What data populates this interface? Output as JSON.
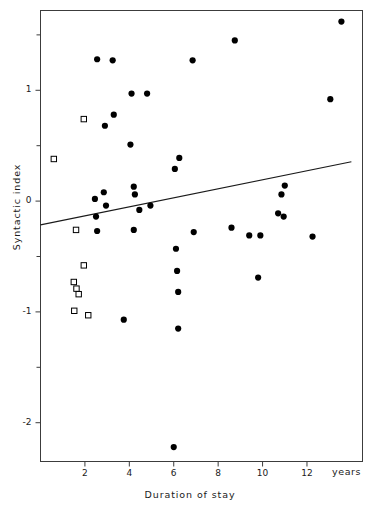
{
  "chart_data": {
    "type": "scatter",
    "title": "",
    "xlabel": "Duration of stay",
    "ylabel": "Syntactic index",
    "x_unit_label": "years",
    "xlim": [
      0.0,
      14.5
    ],
    "ylim": [
      -2.35,
      1.72
    ],
    "xticks": [
      2,
      4,
      6,
      8,
      10,
      12
    ],
    "xtick_labels": [
      "2",
      "4",
      "6",
      "8",
      "10",
      "12"
    ],
    "yticks": [
      1,
      0,
      -1,
      -2
    ],
    "ytick_labels": [
      "1",
      "0",
      "-1",
      "-2"
    ],
    "y_minor_ticks": [
      1.5,
      0.5,
      -0.5,
      -1.5
    ],
    "grid": false,
    "legend": null,
    "series": [
      {
        "name": "filled-circles",
        "marker": "circle-filled",
        "color": "#000000",
        "points": [
          [
            13.55,
            1.62
          ],
          [
            8.75,
            1.45
          ],
          [
            2.55,
            1.28
          ],
          [
            3.25,
            1.27
          ],
          [
            6.85,
            1.27
          ],
          [
            4.1,
            0.97
          ],
          [
            4.8,
            0.97
          ],
          [
            13.05,
            0.92
          ],
          [
            3.3,
            0.78
          ],
          [
            2.9,
            0.68
          ],
          [
            4.05,
            0.51
          ],
          [
            6.25,
            0.39
          ],
          [
            6.05,
            0.29
          ],
          [
            4.2,
            0.13
          ],
          [
            4.25,
            0.06
          ],
          [
            2.85,
            0.08
          ],
          [
            11.0,
            0.14
          ],
          [
            2.45,
            0.02
          ],
          [
            10.85,
            0.06
          ],
          [
            2.95,
            -0.04
          ],
          [
            4.45,
            -0.08
          ],
          [
            4.95,
            -0.04
          ],
          [
            10.7,
            -0.11
          ],
          [
            10.95,
            -0.14
          ],
          [
            2.5,
            -0.14
          ],
          [
            2.55,
            -0.27
          ],
          [
            4.2,
            -0.26
          ],
          [
            8.6,
            -0.24
          ],
          [
            6.9,
            -0.28
          ],
          [
            9.4,
            -0.31
          ],
          [
            9.9,
            -0.31
          ],
          [
            12.25,
            -0.32
          ],
          [
            6.1,
            -0.43
          ],
          [
            6.15,
            -0.63
          ],
          [
            9.8,
            -0.69
          ],
          [
            6.2,
            -0.82
          ],
          [
            3.75,
            -1.07
          ],
          [
            6.2,
            -1.15
          ],
          [
            6.0,
            -2.22
          ]
        ]
      },
      {
        "name": "open-squares",
        "marker": "square-open",
        "color": "#000000",
        "points": [
          [
            1.95,
            0.74
          ],
          [
            0.6,
            0.38
          ],
          [
            1.6,
            -0.26
          ],
          [
            1.95,
            -0.58
          ],
          [
            1.5,
            -0.73
          ],
          [
            1.62,
            -0.79
          ],
          [
            1.72,
            -0.84
          ],
          [
            1.52,
            -0.99
          ],
          [
            2.15,
            -1.03
          ]
        ]
      }
    ],
    "regression_line": {
      "name": "fitted-regression-line",
      "color": "#1a1a1a",
      "x_start": 0.0,
      "y_start": -0.215,
      "x_end": 14.0,
      "y_end": 0.355
    }
  }
}
